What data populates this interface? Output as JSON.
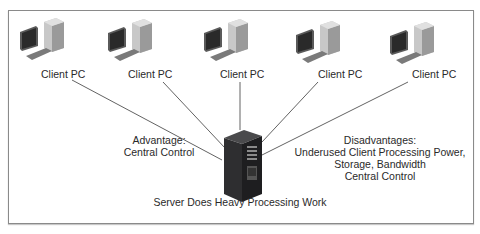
{
  "diagram": {
    "type": "client-server network",
    "clients": [
      {
        "label": "Client PC"
      },
      {
        "label": "Client PC"
      },
      {
        "label": "Client PC"
      },
      {
        "label": "Client PC"
      },
      {
        "label": "Client PC"
      }
    ],
    "server": {
      "label": "Server Does Heavy Processing Work"
    },
    "advantage": {
      "title": "Advantage:",
      "lines": [
        "Central Control"
      ]
    },
    "disadvantages": {
      "title": "Disadvantages:",
      "lines": [
        "Underused Client Processing Power,",
        "Storage, Bandwidth",
        "Central Control"
      ]
    },
    "colors": {
      "frame": "#8a8a8a",
      "lines": "#3a3a3a",
      "server": "#2e2e30",
      "text": "#2a2a2a"
    }
  }
}
